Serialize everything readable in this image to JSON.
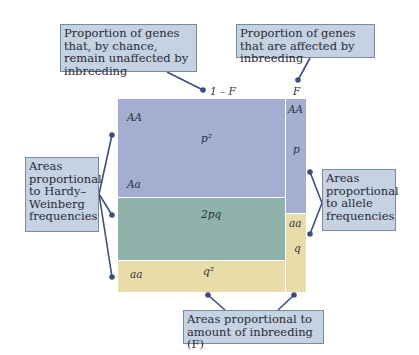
{
  "callouts": {
    "unaffected": "Proportion of genes that, by chance, remain unaffected by inbreeding",
    "affected": "Proportion of genes that are affected by inbreeding",
    "hardy_weinberg": "Areas proportional to Hardy–Weinberg frequencies",
    "allele": "Areas proportional to allele frequencies",
    "inbreeding": "Areas proportional to amount of inbreeding (F)"
  },
  "axis": {
    "left_label": "1 – F",
    "right_label": "F"
  },
  "left_regions": [
    {
      "genotype": "AA",
      "freq": "p²",
      "color": "#a3aed0"
    },
    {
      "genotype": "Aa",
      "freq": "2pq",
      "color": "#8fb3ab"
    },
    {
      "genotype": "aa",
      "freq": "q²",
      "color": "#e8dca8"
    }
  ],
  "right_regions": [
    {
      "genotype": "AA",
      "freq": "p",
      "color": "#a3aed0"
    },
    {
      "genotype": "aa",
      "freq": "q",
      "color": "#e8dca8"
    }
  ],
  "colors": {
    "line": "#3d4f7a",
    "callout_bg": "#c5d2e2"
  }
}
